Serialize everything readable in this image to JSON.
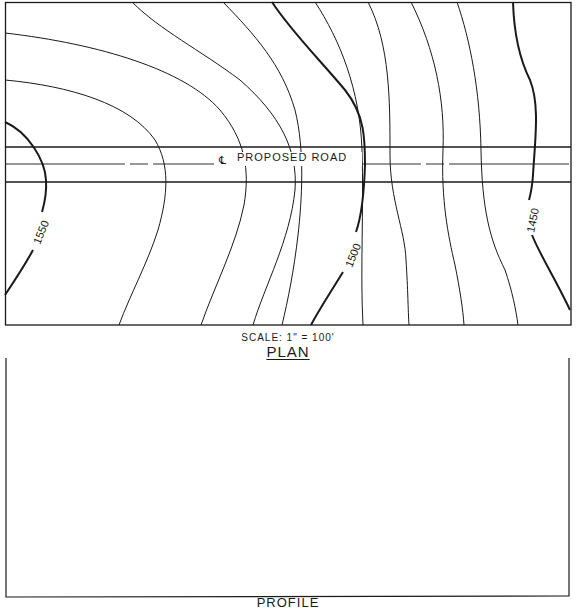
{
  "plan": {
    "road_label": "PROPOSED ROAD",
    "centerline_symbol": "℄",
    "scale": "SCALE: 1\" = 100'",
    "title": "PLAN",
    "contour_labels": {
      "c1550": "1550",
      "c1500": "1500",
      "c1450": "1450"
    },
    "contour_interval_ft": 10,
    "index_contours": [
      "1550",
      "1500",
      "1450"
    ]
  },
  "profile": {
    "title": "PROFILE"
  },
  "colors": {
    "ink": "#1a1a1a",
    "paper": "#ffffff"
  }
}
